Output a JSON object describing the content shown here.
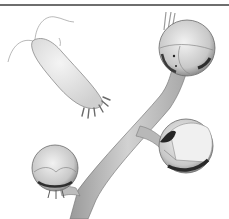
{
  "image": {
    "subject": "scientific illustration of a larva beside a plant stem with flower buds",
    "style": "grayscale pencil drawing",
    "background": "#ffffff"
  },
  "elements": {
    "top_rule": {
      "color": "#6e6e6e",
      "y": 5
    },
    "larva": {
      "fill": "#e6e6e6",
      "outline": "#8a8a8a"
    },
    "stem": {
      "fill": "#bdbdbd",
      "outline": "#7a7a7a"
    },
    "buds": [
      {
        "name": "top-right-bud",
        "cx": 187,
        "cy": 48,
        "r": 28
      },
      {
        "name": "middle-right-bud",
        "cx": 186,
        "cy": 146,
        "r": 27
      },
      {
        "name": "bottom-left-bud",
        "cx": 55,
        "cy": 168,
        "r": 23
      }
    ]
  }
}
